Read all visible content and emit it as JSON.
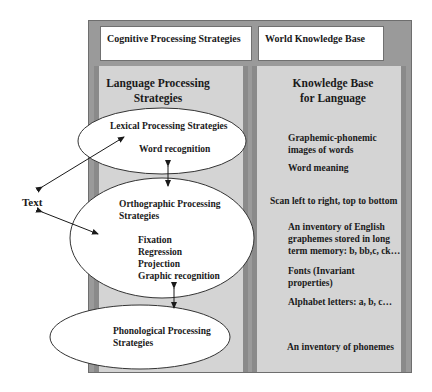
{
  "top_boxes": {
    "cognitive": "Cognitive Processing Strategies",
    "world": "World Knowledge Base"
  },
  "left_panel": {
    "heading_line1": "Language Processing",
    "heading_line2": "Strategies"
  },
  "right_panel": {
    "heading_line1": "Knowledge Base",
    "heading_line2": "for Language",
    "items": [
      {
        "lines": [
          "Graphemic-phonemic",
          "images of words"
        ]
      },
      {
        "lines": [
          "Word meaning"
        ]
      },
      {
        "lines": [
          "Scan left to right, top to bottom"
        ]
      },
      {
        "lines": [
          "An inventory of English",
          "graphemes stored in long",
          "term memory: b, bb,c, ck…"
        ]
      },
      {
        "lines": [
          "Fonts (Invariant",
          "properties)"
        ]
      },
      {
        "lines": [
          "Alphabet letters: a, b, c…"
        ]
      },
      {
        "lines": [
          "An inventory of phonemes"
        ]
      }
    ]
  },
  "ellipses": {
    "lexical": {
      "title": "Lexical Processing Strategies",
      "items": [
        "Word recognition"
      ]
    },
    "orthographic": {
      "title_line1": "Orthographic Processing",
      "title_line2": "Strategies",
      "items": [
        "Fixation",
        "Regression",
        "Projection",
        "Graphic recognition"
      ]
    },
    "phonological": {
      "title_line1": "Phonological Processing",
      "title_line2": "Strategies"
    }
  },
  "external": {
    "text_label": "Text"
  },
  "colors": {
    "frame": "#9a9a9a",
    "panel": "#d4d4d4",
    "panel_border": "#8a8a8a",
    "ellipse_fill": "#ffffff",
    "ink": "#1a1a1a"
  }
}
